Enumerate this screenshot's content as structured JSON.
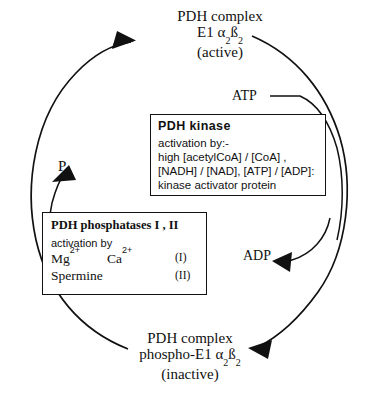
{
  "diagram": {
    "line_color": "#111111",
    "background": "#ffffff"
  },
  "nodes": {
    "top_complex": {
      "line1": "PDH  complex",
      "line2_prefix": "E1 ",
      "line2_alpha": "α",
      "line2_alpha_sub": "2",
      "line2_beta": "ß",
      "line2_beta_sub": "2",
      "line3": "(active)"
    },
    "bottom_complex": {
      "line1": "PDH  complex",
      "line2_prefix": "phospho-E1 ",
      "line2_alpha": "α",
      "line2_alpha_sub": "2",
      "line2_beta": "ß",
      "line2_beta_sub": "2",
      "line3": "(inactive)"
    }
  },
  "molecules": {
    "atp": "ATP",
    "adp": "ADP",
    "pi_symbol": "P",
    "pi_subscript": "i"
  },
  "kinase_box": {
    "title": "PDH  kinase",
    "lines": [
      "activation by:-",
      "high [acetylCoA] / [CoA] ,",
      "[NADH] / [NAD],  [ATP] / [ADP]:",
      "kinase activator protein"
    ]
  },
  "phosphatase_box": {
    "title": "PDH phosphatases I , II",
    "subtitle": "activation by",
    "ion1_name": "Mg",
    "ion1_charge": "2+",
    "ion2_name": "Ca",
    "ion2_charge": "2+",
    "tag1": "(I)",
    "compound": "Spermine",
    "tag2": "(II)"
  }
}
